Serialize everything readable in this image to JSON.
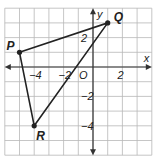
{
  "diagram": {
    "type": "coordinate-plane-triangle",
    "axes": {
      "x_label": "x",
      "y_label": "y",
      "origin_label": "O"
    },
    "grid": {
      "x_min": -6,
      "x_max": 4,
      "y_min": -6,
      "y_max": 4,
      "step": 1
    },
    "ticks": {
      "x": [
        {
          "value": -4,
          "label": "−4"
        },
        {
          "value": -2,
          "label": "−2"
        },
        {
          "value": 2,
          "label": "2"
        }
      ],
      "y": [
        {
          "value": 2,
          "label": "2"
        },
        {
          "value": -2,
          "label": "−2"
        },
        {
          "value": -4,
          "label": "−4"
        }
      ]
    },
    "points": [
      {
        "name": "P",
        "x": -5,
        "y": 1
      },
      {
        "name": "Q",
        "x": 1,
        "y": 3
      },
      {
        "name": "R",
        "x": -4,
        "y": -4
      }
    ],
    "colors": {
      "grid": "#b8b8b8",
      "axis": "#333333",
      "triangle": "#222222"
    }
  }
}
